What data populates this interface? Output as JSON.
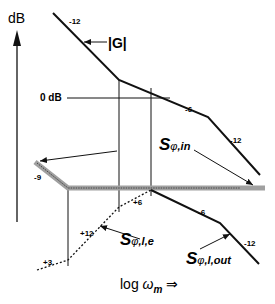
{
  "diagram": {
    "type": "bode-asymptotic-gain-plot",
    "y_axis_label": "dB",
    "x_axis_label": {
      "prefix": "log ",
      "symbol": "ω",
      "subscript": "m",
      "arrow": "⇒"
    },
    "zero_db_label": "0 dB",
    "curves": {
      "G": {
        "label": "|G|",
        "slopes": [
          "-12",
          "-6",
          "-12"
        ]
      },
      "S_in": {
        "symbol": "S",
        "sub_phi": "φ",
        "sub_rest": ",in",
        "slope": "-9"
      },
      "S_le": {
        "symbol": "S",
        "sub_phi": "φ",
        "sub_rest": ",l,e",
        "slopes": [
          "+3",
          "+12",
          "+6"
        ]
      },
      "S_lout": {
        "symbol": "S",
        "sub_phi": "φ",
        "sub_rest": ",l,out",
        "slopes": [
          "-6",
          "-12"
        ]
      }
    },
    "colors": {
      "line": "#111111",
      "band": "#9a9a9a",
      "band_core": "#555555"
    }
  }
}
